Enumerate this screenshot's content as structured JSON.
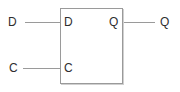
{
  "diagram": {
    "kind": "logic-circuit",
    "component_type": "d-flip-flop",
    "component": {
      "inputs": [
        {
          "external_label": "D",
          "internal_label": "D"
        },
        {
          "external_label": "C",
          "internal_label": "C"
        }
      ],
      "outputs": [
        {
          "external_label": "Q",
          "internal_label": "Q"
        }
      ]
    },
    "colors": {
      "line": "#9a9a9a",
      "text": "#2e2e2e",
      "background": "#ffffff"
    }
  }
}
